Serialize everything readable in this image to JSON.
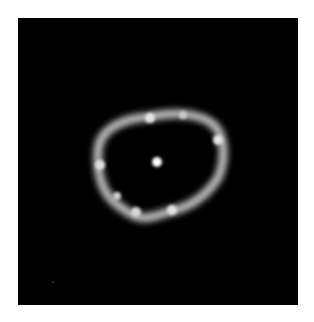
{
  "image": {
    "description": "Astronomical ring image with bright central point source on black background",
    "background_color": "#000000",
    "ring_color": "#d8d8d8",
    "center_color": "#ffffff",
    "ring_knots": [
      {
        "cx": 150,
        "cy": 118,
        "r": 6
      },
      {
        "cx": 183,
        "cy": 115,
        "r": 5
      },
      {
        "cx": 100,
        "cy": 165,
        "r": 6
      },
      {
        "cx": 218,
        "cy": 140,
        "r": 6
      },
      {
        "cx": 117,
        "cy": 196,
        "r": 5
      },
      {
        "cx": 136,
        "cy": 212,
        "r": 6
      },
      {
        "cx": 172,
        "cy": 210,
        "r": 6
      }
    ],
    "center_source": {
      "cx": 157,
      "cy": 162,
      "r": 5
    }
  }
}
